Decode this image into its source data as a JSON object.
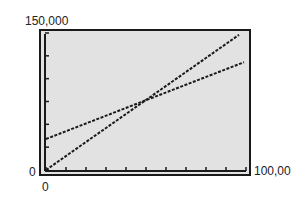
{
  "chart_data": {
    "type": "line",
    "title": "",
    "xlabel": "",
    "ylabel": "",
    "xlim": [
      0,
      100000
    ],
    "ylim": [
      0,
      150000
    ],
    "x_tick_labels": {
      "min": "0",
      "max": "100,00"
    },
    "y_tick_labels": {
      "min": "0",
      "max": "150,000"
    },
    "x_tick_count": 11,
    "y_tick_count": 7,
    "grid": false,
    "legend": null,
    "background_color": "#e2e2e2",
    "line_color": "#1a1a1a",
    "series": [
      {
        "name": "steeper line (through origin)",
        "x": [
          0,
          96500
        ],
        "y": [
          0,
          148000
        ]
      },
      {
        "name": "shallower line (positive intercept)",
        "x": [
          0,
          99000
        ],
        "y": [
          34000,
          118000
        ]
      }
    ],
    "annotations": [
      {
        "text": "intersection",
        "x": 52000,
        "y": 78500
      }
    ]
  }
}
